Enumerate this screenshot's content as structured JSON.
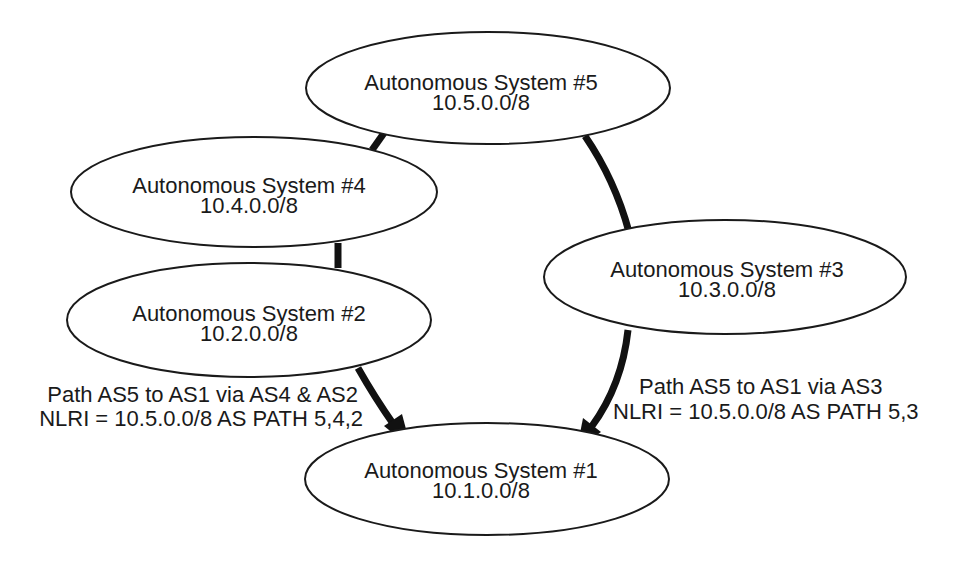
{
  "diagram": {
    "title": "",
    "nodes": [
      {
        "id": "as5",
        "name": "Autonomous System #5",
        "prefix": "10.5.0.0/8",
        "cx": 488,
        "cy": 88,
        "rx": 182,
        "ry": 56
      },
      {
        "id": "as4",
        "name": "Autonomous System #4",
        "prefix": "10.4.0.0/8",
        "cx": 254,
        "cy": 192,
        "rx": 183,
        "ry": 55
      },
      {
        "id": "as2",
        "name": "Autonomous System #2",
        "prefix": "10.2.0.0/8",
        "cx": 249,
        "cy": 320,
        "rx": 182,
        "ry": 57
      },
      {
        "id": "as3",
        "name": "Autonomous System #3",
        "prefix": "10.3.0.0/8",
        "cx": 725,
        "cy": 277,
        "rx": 181,
        "ry": 57
      },
      {
        "id": "as1",
        "name": "Autonomous System #1",
        "prefix": "10.1.0.0/8",
        "cx": 487,
        "cy": 479,
        "rx": 182,
        "ry": 56
      }
    ],
    "edges": [
      {
        "from": "as5",
        "to": "as4",
        "type": "link"
      },
      {
        "from": "as4",
        "to": "as2",
        "type": "link"
      },
      {
        "from": "as5",
        "to": "as3",
        "type": "link"
      },
      {
        "from": "as2",
        "to": "as1",
        "type": "arrow"
      },
      {
        "from": "as3",
        "to": "as1",
        "type": "arrow"
      }
    ],
    "annotations": {
      "left": {
        "line1": "Path AS5 to AS1 via AS4 & AS2",
        "line2": "NLRI = 10.5.0.0/8 AS PATH 5,4,2"
      },
      "right": {
        "line1": "Path AS5 to AS1 via AS3",
        "line2": "NLRI = 10.5.0.0/8 AS PATH 5,3"
      }
    },
    "colors": {
      "stroke": "#111111",
      "text": "#1a1a1a",
      "background": "#ffffff"
    }
  }
}
